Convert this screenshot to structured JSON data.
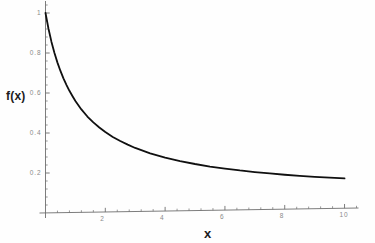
{
  "chart_data": {
    "type": "line",
    "title": "",
    "subtitle": "",
    "xlabel": "x",
    "ylabel": "f(x)",
    "xlim": [
      0,
      10.4
    ],
    "ylim": [
      0,
      1.04
    ],
    "grid": false,
    "legend": null,
    "legend_position": "none",
    "xticks": [
      {
        "value": 2,
        "label": "2"
      },
      {
        "value": 4,
        "label": "4"
      },
      {
        "value": 6,
        "label": "6"
      },
      {
        "value": 8,
        "label": "8"
      },
      {
        "value": 10,
        "label": "10"
      }
    ],
    "yticks": [
      {
        "value": 0.2,
        "label": "0.2"
      },
      {
        "value": 0.4,
        "label": "0.4"
      },
      {
        "value": 0.6,
        "label": "0.6"
      },
      {
        "value": 0.8,
        "label": "0.8"
      },
      {
        "value": 1.0,
        "label": "1"
      }
    ],
    "x_minor_tick_step": 0.4,
    "y_minor_tick_step": 0.04,
    "series": [
      {
        "name": "f(x)",
        "color": "#101010",
        "line_width": 1.8,
        "x": [
          0,
          0.1,
          0.2,
          0.3,
          0.4,
          0.5,
          0.6,
          0.7,
          0.8,
          0.9,
          1.0,
          1.2,
          1.4,
          1.6,
          1.8,
          2.0,
          2.25,
          2.5,
          2.75,
          3.0,
          3.5,
          4.0,
          4.5,
          5.0,
          5.5,
          6.0,
          6.5,
          7.0,
          7.5,
          8.0,
          8.5,
          9.0,
          9.5,
          10.0
        ],
        "y": [
          1.0,
          0.921,
          0.855,
          0.799,
          0.751,
          0.709,
          0.672,
          0.639,
          0.609,
          0.583,
          0.558,
          0.515,
          0.479,
          0.449,
          0.423,
          0.4,
          0.375,
          0.354,
          0.335,
          0.318,
          0.29,
          0.267,
          0.249,
          0.233,
          0.219,
          0.208,
          0.197,
          0.188,
          0.18,
          0.172,
          0.165,
          0.159,
          0.154,
          0.149
        ]
      }
    ],
    "annotations": []
  },
  "axes": {
    "y_axis_title": "f(x)",
    "x_axis_title": "x"
  }
}
